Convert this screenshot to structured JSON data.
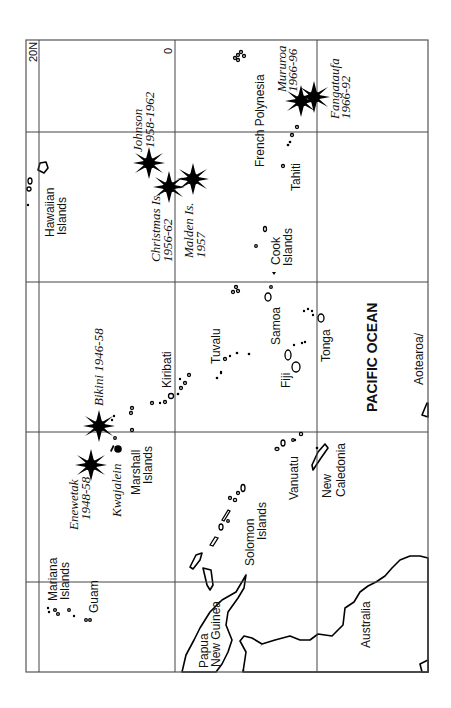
{
  "map": {
    "title": "Pacific nuclear test sites",
    "orientation": "rotated 90 degrees counter-clockwise",
    "latitude_labels": {
      "north20": "20N",
      "equator": "0"
    },
    "ocean_label": "PACIFIC OCEAN",
    "regions": {
      "hawaiian": [
        "Hawaiian",
        "Islands"
      ],
      "french_polynesia": "French Polynesia",
      "tahiti": "Tahiti",
      "cook": [
        "Cook",
        "Islands"
      ],
      "samoa": "Samoa",
      "tonga": "Tonga",
      "fiji": "Fiji",
      "tuvalu": "Tuvalu",
      "kiribati": "Kiribati",
      "marshall": [
        "Marshall",
        "Islands"
      ],
      "mariana": [
        "Mariana",
        "Islands"
      ],
      "guam": "Guam",
      "solomon": [
        "Solomon",
        "Islands"
      ],
      "vanuatu": "Vanuatu",
      "new_caledonia": [
        "New",
        "Caledonia"
      ],
      "png": [
        "Papua",
        "New Guinea"
      ],
      "australia": "Australia",
      "aotearoa": "Aotearoa/"
    },
    "test_sites": [
      {
        "name": "Johnson",
        "years": "1958-1962"
      },
      {
        "name": "Christmas Is.",
        "years": "1956-62"
      },
      {
        "name": "Malden Is.",
        "years": "1957"
      },
      {
        "name": "Mururoa",
        "years": "1966-96"
      },
      {
        "name": "Fangataufa",
        "years": "1966-92"
      },
      {
        "name": "Bikini",
        "years": "1946-58",
        "label": "Bikini 1946-58"
      },
      {
        "name": "Enewetak",
        "years": "1948-58"
      }
    ],
    "other_sites": [
      {
        "name": "Kwajalein"
      }
    ],
    "colors": {
      "ink": "#000000",
      "grid": "#444444",
      "background": "#ffffff"
    }
  }
}
